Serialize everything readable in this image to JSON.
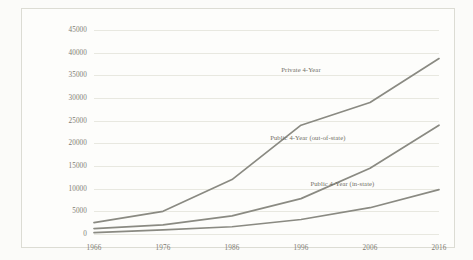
{
  "chart_data": {
    "type": "line",
    "title": "",
    "xlabel": "",
    "ylabel": "",
    "x": [
      1966,
      1976,
      1986,
      1996,
      2006,
      2016
    ],
    "categories": [
      "1966",
      "1976",
      "1986",
      "1996",
      "2006",
      "2016"
    ],
    "xlim": [
      1966,
      2016
    ],
    "ylim": [
      0,
      45000
    ],
    "yticks": [
      0,
      5000,
      10000,
      15000,
      20000,
      25000,
      30000,
      35000,
      40000,
      45000
    ],
    "ytick_labels": [
      "0",
      "5000",
      "10000",
      "15000",
      "20000",
      "25000",
      "30000",
      "35000",
      "40000",
      "45000"
    ],
    "grid": "horizontal",
    "legend_position": "inline-labels",
    "line_color": "#8a8a82",
    "grid_color": "#e8e8e0",
    "series": [
      {
        "name": "Private 4-Year",
        "label": "Private 4-Year",
        "values": [
          2500,
          5000,
          12000,
          24000,
          29000,
          38700
        ],
        "label_x": 1996,
        "label_y": 36500
      },
      {
        "name": "Public 4-Year (out-of-state)",
        "label": "Public 4-Year (out-of-state)",
        "values": [
          1200,
          2000,
          4000,
          7800,
          14500,
          24000
        ],
        "label_x": 1997,
        "label_y": 21500
      },
      {
        "name": "Public 4-Year (in-state)",
        "label": "Public 4-Year (in-state)",
        "values": [
          300,
          900,
          1600,
          3200,
          5800,
          9800
        ],
        "label_x": 2002,
        "label_y": 11200
      }
    ]
  }
}
